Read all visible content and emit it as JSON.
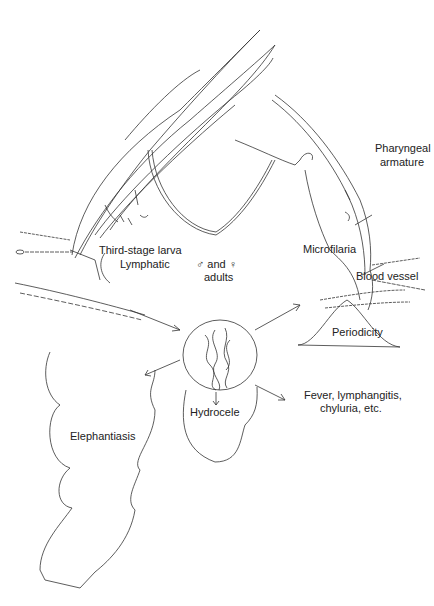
{
  "labels": {
    "third_stage_larva": "Third-stage larva",
    "lymphatic": "Lymphatic",
    "adults_line1": "♂ and ♀",
    "adults_line2": "adults",
    "pharyngeal_line1": "Pharyngeal",
    "pharyngeal_line2": "armature",
    "microfilaria": "Microfilaria",
    "blood_vessel": "Blood vessel",
    "periodicity": "Periodicity",
    "elephantiasis": "Elephantiasis",
    "hydrocele": "Hydrocele",
    "fever_line1": "Fever, lymphangitis,",
    "fever_line2": "chyluria, etc."
  },
  "colors": {
    "line": "#333333",
    "background": "#ffffff"
  }
}
